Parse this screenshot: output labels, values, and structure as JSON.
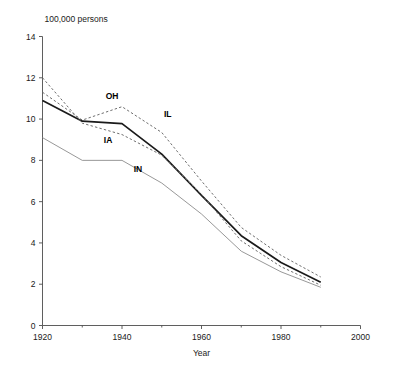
{
  "chart_data": {
    "type": "line",
    "title": "",
    "subtitle": "",
    "unit_label": "100,000 persons",
    "xlabel": "Year",
    "ylabel": "",
    "xlim": [
      1920,
      2000
    ],
    "ylim": [
      0,
      14
    ],
    "x_ticks": [
      1920,
      1940,
      1960,
      1980,
      2000
    ],
    "x_tick_labels": [
      "1920",
      "1940",
      "1960",
      "1980",
      "2000"
    ],
    "x_minor_ticks": [
      1930,
      1950,
      1970,
      1990
    ],
    "y_ticks": [
      0,
      2,
      4,
      6,
      8,
      10,
      12,
      14
    ],
    "y_tick_labels": [
      "0",
      "2",
      "4",
      "6",
      "8",
      "10",
      "12",
      "14"
    ],
    "grid": false,
    "legend": "inline-labels",
    "x": [
      1920,
      1930,
      1940,
      1950,
      1960,
      1970,
      1980,
      1990
    ],
    "series": [
      {
        "name": "OH",
        "label": "OH",
        "style": "dashed",
        "color": "#6e6e6e",
        "width": 1.0,
        "values": [
          11.3,
          9.95,
          10.6,
          9.35,
          7.0,
          4.75,
          3.4,
          2.35
        ],
        "label_x": 1937.5,
        "label_y": 10.95
      },
      {
        "name": "IL",
        "label": "IL",
        "style": "solid-bold",
        "color": "#1a1a1a",
        "width": 1.7,
        "values": [
          10.9,
          9.9,
          9.78,
          8.3,
          6.3,
          4.35,
          3.05,
          2.1
        ],
        "label_x": 1951.5,
        "label_y": 10.1
      },
      {
        "name": "IA",
        "label": "IA",
        "style": "dashed",
        "color": "#6e6e6e",
        "width": 1.0,
        "values": [
          12.0,
          9.8,
          9.25,
          8.25,
          6.35,
          4.1,
          2.85,
          1.95
        ],
        "label_x": 1936.5,
        "label_y": 8.85
      },
      {
        "name": "IN",
        "label": "IN",
        "style": "solid-thin",
        "color": "#8c8c8c",
        "width": 0.9,
        "values": [
          9.1,
          8.0,
          8.0,
          6.9,
          5.4,
          3.6,
          2.6,
          1.85
        ],
        "label_x": 1944.0,
        "label_y": 7.45
      }
    ],
    "annotations": []
  },
  "accessibility": {
    "figure_name": "line-chart-persons-by-state-1920-1990"
  }
}
